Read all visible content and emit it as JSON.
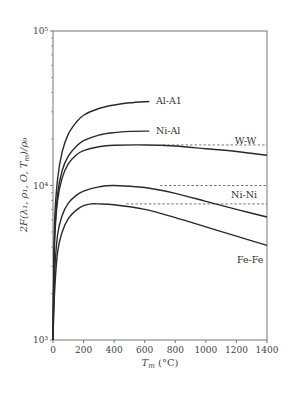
{
  "chart_data": {
    "type": "line",
    "title": "",
    "xlabel": "T_m (°C)",
    "ylabel": "2F(λ1, ρ1, O, T_m)/ρ0",
    "xlim": [
      0,
      1400
    ],
    "ylim": [
      1000,
      100000
    ],
    "yscale": "log",
    "grid": false,
    "legend_position": "inline labels",
    "x_ticks": [
      0,
      200,
      400,
      600,
      800,
      1000,
      1200,
      1400
    ],
    "x_tick_labels": [
      "0",
      "200",
      "400",
      "600",
      "800",
      "1000",
      "1200",
      "1400"
    ],
    "y_ticks": [
      1000,
      10000,
      100000
    ],
    "y_tick_labels": [
      "10³",
      "10⁴",
      "10⁵"
    ],
    "series": [
      {
        "name": "Al-A1",
        "style": "solid",
        "x": [
          0,
          10,
          30,
          60,
          100,
          150,
          200,
          300,
          400,
          500,
          630
        ],
        "values": [
          1000,
          5500,
          11000,
          16500,
          21500,
          25500,
          28500,
          31500,
          33200,
          34300,
          35000
        ],
        "label_at": [
          660,
          35000
        ]
      },
      {
        "name": "Ni-Al",
        "style": "solid",
        "x": [
          0,
          10,
          30,
          60,
          100,
          150,
          200,
          300,
          400,
          500,
          630
        ],
        "values": [
          1000,
          4500,
          8800,
          12500,
          15500,
          17800,
          19500,
          21200,
          22000,
          22400,
          22500
        ],
        "label_at": [
          660,
          22500
        ]
      },
      {
        "name": "W-W",
        "style": "solid",
        "x": [
          0,
          10,
          30,
          60,
          100,
          150,
          200,
          300,
          400,
          600,
          800,
          1000,
          1200,
          1400
        ],
        "values": [
          1000,
          4200,
          8000,
          11200,
          13800,
          15700,
          16800,
          17800,
          18200,
          18300,
          18000,
          17300,
          16600,
          15700
        ],
        "label_at": [
          1260,
          19500
        ],
        "reference_line": 18300
      },
      {
        "name": "Ni-Ni",
        "style": "solid",
        "x": [
          0,
          10,
          30,
          60,
          100,
          150,
          200,
          300,
          400,
          600,
          800,
          1000,
          1200,
          1400
        ],
        "values": [
          1000,
          2600,
          4800,
          6400,
          7700,
          8600,
          9200,
          9800,
          10000,
          9700,
          8900,
          7900,
          7000,
          6250
        ],
        "label_at": [
          1250,
          8700
        ],
        "reference_line": 10000
      },
      {
        "name": "Fe-Fe",
        "style": "solid",
        "x": [
          0,
          10,
          30,
          60,
          100,
          150,
          200,
          250,
          300,
          400,
          600,
          800,
          1000,
          1200,
          1400
        ],
        "values": [
          1000,
          2000,
          3700,
          5000,
          6100,
          6900,
          7400,
          7600,
          7600,
          7500,
          7000,
          6200,
          5400,
          4700,
          4100
        ],
        "label_at": [
          1290,
          3300
        ],
        "reference_line": 7600
      }
    ],
    "reference_lines": [
      {
        "series": "W-W",
        "y": 18300,
        "x_from": 720,
        "x_to": 1400,
        "style": "dashed"
      },
      {
        "series": "Ni-Ni",
        "y": 10000,
        "x_from": 700,
        "x_to": 1400,
        "style": "dashed"
      },
      {
        "series": "Fe-Fe",
        "y": 7600,
        "x_from": 480,
        "x_to": 1400,
        "style": "dashed"
      }
    ]
  },
  "axes": {
    "x_title_main": "T",
    "x_title_sub": "m",
    "x_title_unit": " (°C)",
    "y_title": "2F(λ₁, ρ₁, O, T",
    "y_title_sub": "m",
    "y_title_end": ")/ρ₀"
  }
}
